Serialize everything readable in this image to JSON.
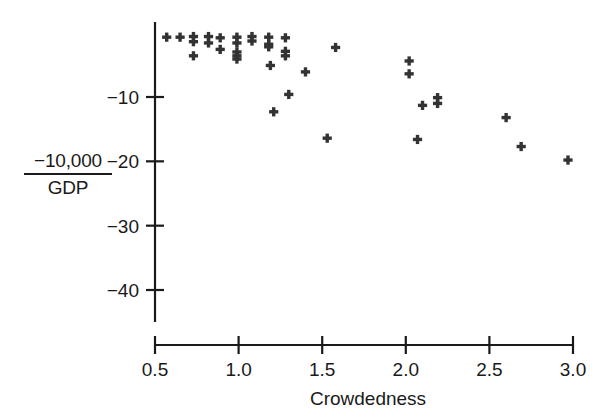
{
  "chart_data": {
    "type": "scatter",
    "title": "",
    "subtitle": "",
    "xlabel": "Crowdedness",
    "ylabel": "-10,000 / GDP",
    "ylabel_numerator": "−10,000",
    "ylabel_denominator": "GDP",
    "xlim": [
      0.42,
      3.08
    ],
    "ylim": [
      -44.5,
      0.4
    ],
    "xticks": [
      0.5,
      1.0,
      1.5,
      2.0,
      2.5,
      3.0
    ],
    "xticklabels": [
      "0.5",
      "1.0",
      "1.5",
      "2.0",
      "2.5",
      "3.0"
    ],
    "yticks": [
      -10,
      -20,
      -30,
      -40
    ],
    "yticklabels": [
      "−10",
      "−20",
      "−30",
      "−40"
    ],
    "grid": false,
    "legend": null,
    "marker": "plus",
    "marker_color": "#333333",
    "points": [
      {
        "x": 0.57,
        "y": -0.7
      },
      {
        "x": 0.65,
        "y": -0.7
      },
      {
        "x": 0.73,
        "y": -0.6
      },
      {
        "x": 0.73,
        "y": -1.4
      },
      {
        "x": 0.73,
        "y": -3.6
      },
      {
        "x": 0.82,
        "y": -0.6
      },
      {
        "x": 0.82,
        "y": -1.6
      },
      {
        "x": 0.89,
        "y": -0.8
      },
      {
        "x": 0.89,
        "y": -2.6
      },
      {
        "x": 0.99,
        "y": -0.7
      },
      {
        "x": 0.99,
        "y": -1.6
      },
      {
        "x": 0.99,
        "y": -3.0
      },
      {
        "x": 0.99,
        "y": -3.6
      },
      {
        "x": 0.99,
        "y": -4.1
      },
      {
        "x": 1.08,
        "y": -0.6
      },
      {
        "x": 1.08,
        "y": -1.3
      },
      {
        "x": 1.18,
        "y": -0.7
      },
      {
        "x": 1.18,
        "y": -1.8
      },
      {
        "x": 1.18,
        "y": -2.2
      },
      {
        "x": 1.19,
        "y": -5.1
      },
      {
        "x": 1.21,
        "y": -12.3
      },
      {
        "x": 1.28,
        "y": -0.8
      },
      {
        "x": 1.28,
        "y": -2.9
      },
      {
        "x": 1.28,
        "y": -3.6
      },
      {
        "x": 1.3,
        "y": -9.6
      },
      {
        "x": 1.4,
        "y": -6.1
      },
      {
        "x": 1.53,
        "y": -16.4
      },
      {
        "x": 1.58,
        "y": -2.3
      },
      {
        "x": 2.02,
        "y": -4.4
      },
      {
        "x": 2.02,
        "y": -6.4
      },
      {
        "x": 2.07,
        "y": -16.6
      },
      {
        "x": 2.1,
        "y": -11.3
      },
      {
        "x": 2.19,
        "y": -10.1
      },
      {
        "x": 2.19,
        "y": -11.0
      },
      {
        "x": 2.6,
        "y": -13.2
      },
      {
        "x": 2.69,
        "y": -17.7
      },
      {
        "x": 2.97,
        "y": -19.8
      }
    ]
  },
  "axes": {
    "x_axis_name": "crowdedness-axis",
    "y_axis_name": "gdp-axis"
  }
}
